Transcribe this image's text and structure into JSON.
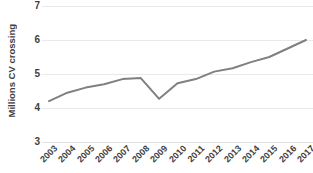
{
  "chart_data": {
    "type": "line",
    "title": "",
    "xlabel": "",
    "ylabel": "Millions CV crossing",
    "categories": [
      "2003",
      "2004",
      "2005",
      "2006",
      "2007",
      "2008",
      "2009",
      "2010",
      "2011",
      "2012",
      "2013",
      "2014",
      "2015",
      "2016",
      "2017"
    ],
    "values": [
      4.2,
      4.45,
      4.6,
      4.7,
      4.85,
      4.88,
      4.27,
      4.73,
      4.85,
      5.07,
      5.17,
      5.35,
      5.5,
      5.75,
      6.0
    ],
    "series": [
      {
        "name": "Millions CV crossing",
        "values": [
          4.2,
          4.45,
          4.6,
          4.7,
          4.85,
          4.88,
          4.27,
          4.73,
          4.85,
          5.07,
          5.17,
          5.35,
          5.5,
          5.75,
          6.0
        ]
      }
    ],
    "ylim": [
      3,
      7
    ],
    "yticks": [
      3,
      4,
      5,
      6,
      7
    ],
    "ytick_labels": [
      "3",
      "4",
      "5",
      "6",
      "7"
    ],
    "grid": true,
    "legend": "none",
    "line_color": "#808080",
    "grid_color": "#e9e9e9",
    "text_color": "#3f3f3f",
    "background": "#ffffff"
  }
}
